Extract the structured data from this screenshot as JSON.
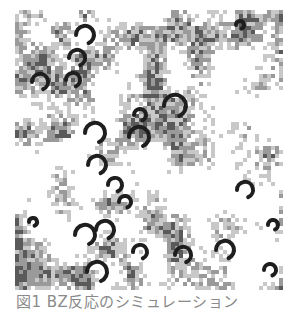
{
  "figure": {
    "caption": "図1 BZ反応のシミュレーション",
    "grid": {
      "cols": 67,
      "rows": 70,
      "cell": 4,
      "seed": 7
    },
    "colors": {
      "background": "#ffffff",
      "light": "#c8c8c8",
      "mid": "#9a9a9a",
      "dark": "#5a5a5a",
      "spiral": "#1e1e1e"
    },
    "spirals": [
      {
        "x": 70,
        "y": 25,
        "r": 9
      },
      {
        "x": 62,
        "y": 48,
        "r": 8
      },
      {
        "x": 58,
        "y": 70,
        "r": 7
      },
      {
        "x": 25,
        "y": 72,
        "r": 8
      },
      {
        "x": 80,
        "y": 123,
        "r": 10
      },
      {
        "x": 82,
        "y": 155,
        "r": 9
      },
      {
        "x": 100,
        "y": 175,
        "r": 7
      },
      {
        "x": 110,
        "y": 192,
        "r": 6
      },
      {
        "x": 70,
        "y": 225,
        "r": 10
      },
      {
        "x": 90,
        "y": 220,
        "r": 9
      },
      {
        "x": 82,
        "y": 262,
        "r": 10
      },
      {
        "x": 124,
        "y": 127,
        "r": 10
      },
      {
        "x": 160,
        "y": 96,
        "r": 11
      },
      {
        "x": 125,
        "y": 105,
        "r": 6
      },
      {
        "x": 210,
        "y": 240,
        "r": 9
      },
      {
        "x": 125,
        "y": 242,
        "r": 7
      },
      {
        "x": 168,
        "y": 245,
        "r": 8
      },
      {
        "x": 230,
        "y": 180,
        "r": 8
      },
      {
        "x": 258,
        "y": 215,
        "r": 5
      },
      {
        "x": 225,
        "y": 15,
        "r": 4
      },
      {
        "x": 18,
        "y": 212,
        "r": 4
      },
      {
        "x": 255,
        "y": 260,
        "r": 6
      }
    ]
  }
}
